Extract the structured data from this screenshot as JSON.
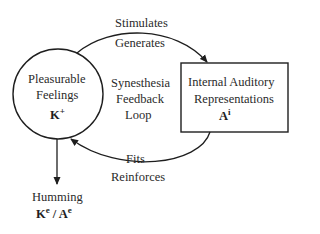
{
  "diagram": {
    "node_feelings": {
      "label_line1": "Pleasurable",
      "label_line2": "Feelings",
      "symbol_base": "K",
      "symbol_sup": "+"
    },
    "node_auditory": {
      "label_line1": "Internal Auditory",
      "label_line2": "Representations",
      "symbol_base": "A",
      "symbol_sup": "i"
    },
    "center_label": {
      "line1": "Synesthesia",
      "line2": "Feedback",
      "line3": "Loop"
    },
    "top_arrow": {
      "label_above": "Stimulates",
      "label_below": "Generates"
    },
    "bottom_arrow": {
      "label_above": "Fits",
      "label_below": "Reinforces"
    },
    "output": {
      "label": "Humming",
      "symbol1_base": "K",
      "symbol1_sup": "e",
      "separator": "/",
      "symbol2_base": "A",
      "symbol2_sup": "e"
    }
  }
}
